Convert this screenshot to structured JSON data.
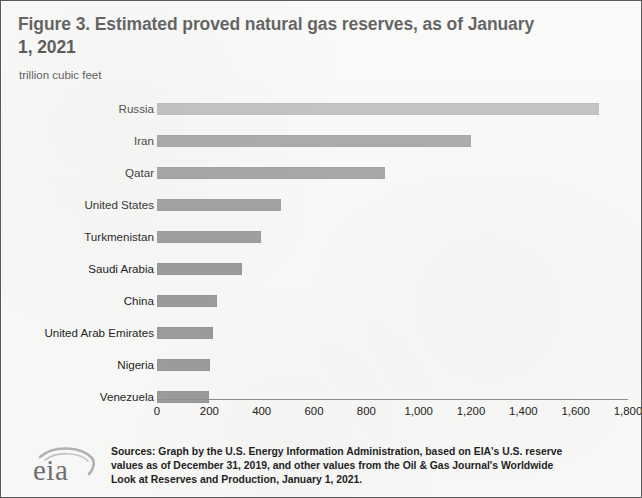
{
  "figure": {
    "title": "Figure 3. Estimated proved natural gas reserves, as of January 1, 2021",
    "subtitle": "trillion cubic feet",
    "border_color": "#5a5a5a",
    "background_color": "#f7f7f5",
    "bar_color": "#9b9b9b",
    "top_bar_color": "#b4b4b4"
  },
  "logo": {
    "wordmark": "eia",
    "icon_name": "eia-swoosh-icon"
  },
  "source": {
    "lines": [
      "Sources: Graph by the U.S. Energy Information Administration, based on EIA's U.S. reserve",
      "values as of December 31, 2019, and other values from the Oil & Gas Journal's Worldwide",
      "Look at Reserves and Production, January 1, 2021."
    ]
  },
  "chart_data": {
    "type": "bar",
    "orientation": "horizontal",
    "title": "Figure 3. Estimated proved natural gas reserves, as of January 1, 2021",
    "subtitle": "trillion cubic feet",
    "xlabel": "",
    "ylabel": "",
    "unit": "trillion cubic feet",
    "xlim": [
      0,
      1800
    ],
    "xticks": [
      0,
      200,
      400,
      600,
      800,
      1000,
      1200,
      1400,
      1600,
      1800
    ],
    "xtick_labels": [
      "0",
      "200",
      "400",
      "600",
      "800",
      "1,000",
      "1,200",
      "1,400",
      "1,600",
      "1,800"
    ],
    "grid": false,
    "legend": null,
    "categories": [
      "Russia",
      "Iran",
      "Qatar",
      "United States",
      "Turkmenistan",
      "Saudi Arabia",
      "China",
      "United Arab Emirates",
      "Nigeria",
      "Venezuela"
    ],
    "values": [
      1688,
      1201,
      872,
      474,
      398,
      325,
      229,
      214,
      203,
      199
    ]
  }
}
